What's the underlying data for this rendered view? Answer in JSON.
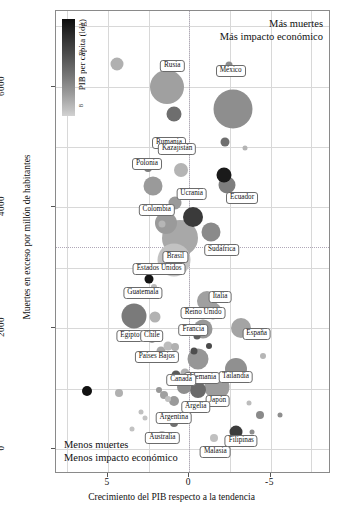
{
  "chart_data": {
    "type": "scatter",
    "title": "",
    "xlabel": "Crecimiento del PIB respecto a la tendencia",
    "ylabel": "Muertes en exceso por millón de habitantes",
    "xlim": [
      8.2,
      -8.6
    ],
    "ylim": [
      -380,
      7250
    ],
    "xticks": [
      5,
      0,
      -5
    ],
    "xtick_labels": [
      "5",
      "0",
      "-5"
    ],
    "yticks": [
      0,
      2000,
      4000,
      6000
    ],
    "ytick_labels": [
      "0",
      "2000",
      "4000",
      "6000"
    ],
    "grid": true,
    "zero_reference_lines": {
      "x": 0,
      "y": 3350
    },
    "legend_position": "top-left-inside",
    "colorbar": {
      "label": "PIB per cápita (log)",
      "ticks": [
        "8",
        "9",
        "10",
        "11"
      ],
      "low_color": "#d2d2d2",
      "high_color": "#0d0d0d"
    },
    "annotations": {
      "top_right_line1": "Más muertes",
      "top_right_line2": "Más impacto económico",
      "bottom_left_line1": "Menos muertes",
      "bottom_left_line2": "Menos impacto económico"
    },
    "points": [
      {
        "label": "Rusia",
        "x": 1.35,
        "y": 5990,
        "size": 34,
        "color": "#a0a0a0",
        "lx": 1.05,
        "ly": 6340
      },
      {
        "label": "Rumania",
        "x": 0.95,
        "y": 5540,
        "size": 15,
        "color": "#6e6e6e",
        "lx": 1.25,
        "ly": 5060
      },
      {
        "label": "México",
        "x": -2.7,
        "y": 5630,
        "size": 39,
        "color": "#8e8e8e",
        "lx": -2.55,
        "ly": 6260
      },
      {
        "label": "Kazajistán",
        "x": 0.5,
        "y": 4620,
        "size": 14,
        "color": "#b4b4b4",
        "lx": 0.75,
        "ly": 4960
      },
      {
        "label": "Polonia",
        "x": 2.25,
        "y": 4360,
        "size": 19,
        "color": "#9a9a9a",
        "lx": 2.6,
        "ly": 4720
      },
      {
        "label": "Ecuador",
        "x": -2.35,
        "y": 4370,
        "size": 17,
        "color": "#7e7e7e",
        "lx": -3.25,
        "ly": 4160
      },
      {
        "label": "Ucrania",
        "x": -0.25,
        "y": 3840,
        "size": 20,
        "color": "#3a3a3a",
        "lx": -0.15,
        "ly": 4220
      },
      {
        "label": "Colombia",
        "x": 1.45,
        "y": 3740,
        "size": 22,
        "color": "#9a9a9a",
        "lx": 2.0,
        "ly": 3960
      },
      {
        "label": "Sudáfrica",
        "x": -1.35,
        "y": 3600,
        "size": 19,
        "color": "#8a8a8a",
        "lx": -2.0,
        "ly": 3290
      },
      {
        "label": "Brasil",
        "x": 0.55,
        "y": 3500,
        "size": 36,
        "color": "#a8a8a8",
        "lx": 0.85,
        "ly": 3180
      },
      {
        "label": "Estados Unidos",
        "x": 0.95,
        "y": 3130,
        "size": 33,
        "color": "#c2c2c2",
        "lx": 1.85,
        "ly": 2980
      },
      {
        "label": "Guatemala",
        "x": 2.45,
        "y": 2820,
        "size": 9,
        "color": "#141414",
        "lx": 2.85,
        "ly": 2580
      },
      {
        "label": "Egipto",
        "x": 3.4,
        "y": 2200,
        "size": 25,
        "color": "#7a7a7a",
        "lx": 3.65,
        "ly": 1880
      },
      {
        "label": "Italia",
        "x": -1.1,
        "y": 2450,
        "size": 20,
        "color": "#a0a0a0",
        "lx": -1.9,
        "ly": 2520
      },
      {
        "label": "Reino Unido",
        "x": -1.45,
        "y": 2290,
        "size": 17,
        "color": "#a0a0a0",
        "lx": -0.85,
        "ly": 2260
      },
      {
        "label": "Francia",
        "x": -0.85,
        "y": 1980,
        "size": 19,
        "color": "#989898",
        "lx": -0.25,
        "ly": 1970
      },
      {
        "label": "España",
        "x": -3.2,
        "y": 2000,
        "size": 20,
        "color": "#a4a4a4",
        "lx": -4.15,
        "ly": 1900
      },
      {
        "label": "Chile",
        "x": 2.3,
        "y": 1840,
        "size": 10,
        "color": "#9e9e9e",
        "lx": 2.3,
        "ly": 1880
      },
      {
        "label": "Países Bajos",
        "x": 1.75,
        "y": 1620,
        "size": 9,
        "color": "#a8a8a8",
        "lx": 2.0,
        "ly": 1530
      },
      {
        "label": "Alemania",
        "x": -0.55,
        "y": 1490,
        "size": 21,
        "color": "#969696",
        "lx": -0.8,
        "ly": 1180
      },
      {
        "label": "Tailandia",
        "x": -2.9,
        "y": 1320,
        "size": 22,
        "color": "#909090",
        "lx": -2.85,
        "ly": 1200
      },
      {
        "label": "Canadá",
        "x": 0.25,
        "y": 1260,
        "size": 9,
        "color": "#b0b0b0",
        "lx": 0.5,
        "ly": 1140
      },
      {
        "label": "Japón",
        "x": -1.7,
        "y": 1020,
        "size": 25,
        "color": "#9c9c9c",
        "lx": -1.75,
        "ly": 800
      },
      {
        "label": "Argelia",
        "x": -0.55,
        "y": 980,
        "size": 16,
        "color": "#6a6a6a",
        "lx": -0.4,
        "ly": 700
      },
      {
        "label": "Argentina",
        "x": 0.95,
        "y": 790,
        "size": 10,
        "color": "#9a9a9a",
        "lx": 0.95,
        "ly": 520
      },
      {
        "label": "Australia",
        "x": 1.65,
        "y": 230,
        "size": 8,
        "color": "#b8b8b8",
        "lx": 1.65,
        "ly": 180
      },
      {
        "label": "Filipinas",
        "x": -2.85,
        "y": 290,
        "size": 13,
        "color": "#3c3c3c",
        "lx": -3.2,
        "ly": 130
      },
      {
        "label": "Malasia",
        "x": -1.5,
        "y": 190,
        "size": 8,
        "color": "#c0c0c0",
        "lx": -1.6,
        "ly": -40
      },
      {
        "label": "",
        "x": 4.45,
        "y": 6370,
        "size": 13,
        "color": "#b0b0b0",
        "lx": null,
        "ly": null
      },
      {
        "label": "",
        "x": -2.45,
        "y": 6360,
        "size": 7,
        "color": "#8c8c8c",
        "lx": null,
        "ly": null
      },
      {
        "label": "",
        "x": -2.2,
        "y": 5080,
        "size": 9,
        "color": "#6e6e6e",
        "lx": null,
        "ly": null
      },
      {
        "label": "",
        "x": -3.4,
        "y": 4980,
        "size": 5,
        "color": "#b4b4b4",
        "lx": null,
        "ly": null
      },
      {
        "label": "",
        "x": 2.55,
        "y": 4650,
        "size": 8,
        "color": "#7e7e7e",
        "lx": null,
        "ly": null
      },
      {
        "label": "",
        "x": -2.15,
        "y": 4530,
        "size": 15,
        "color": "#1a1a1a",
        "lx": null,
        "ly": null
      },
      {
        "label": "",
        "x": 1.7,
        "y": 3720,
        "size": 7,
        "color": "#b6b6b6",
        "lx": null,
        "ly": null
      },
      {
        "label": "",
        "x": 0.9,
        "y": 4080,
        "size": 13,
        "color": "#9a9a9a",
        "lx": null,
        "ly": null
      },
      {
        "label": "",
        "x": 2.15,
        "y": 2690,
        "size": 6,
        "color": "#bcbcbc",
        "lx": null,
        "ly": null
      },
      {
        "label": "",
        "x": 2.1,
        "y": 2190,
        "size": 11,
        "color": "#b2b2b2",
        "lx": null,
        "ly": null
      },
      {
        "label": "",
        "x": -1.8,
        "y": 2520,
        "size": 10,
        "color": "#a8a8a8",
        "lx": null,
        "ly": null
      },
      {
        "label": "",
        "x": -0.5,
        "y": 1870,
        "size": 7,
        "color": "#5e5e5e",
        "lx": null,
        "ly": null
      },
      {
        "label": "",
        "x": -0.3,
        "y": 1620,
        "size": 7,
        "color": "#4e4e4e",
        "lx": null,
        "ly": null
      },
      {
        "label": "",
        "x": 1.3,
        "y": 1700,
        "size": 9,
        "color": "#bcbcbc",
        "lx": null,
        "ly": null
      },
      {
        "label": "",
        "x": 0.85,
        "y": 1690,
        "size": 8,
        "color": "#b0b0b0",
        "lx": null,
        "ly": null
      },
      {
        "label": "",
        "x": -1.2,
        "y": 1700,
        "size": 6,
        "color": "#4a4a4a",
        "lx": null,
        "ly": null
      },
      {
        "label": "",
        "x": 0.35,
        "y": 1020,
        "size": 14,
        "color": "#8e8e8e",
        "lx": null,
        "ly": null
      },
      {
        "label": "",
        "x": 0.8,
        "y": 1230,
        "size": 9,
        "color": "#5a5a5a",
        "lx": null,
        "ly": null
      },
      {
        "label": "",
        "x": 1.55,
        "y": 900,
        "size": 8,
        "color": "#a0a0a0",
        "lx": null,
        "ly": null
      },
      {
        "label": "",
        "x": 1.85,
        "y": 980,
        "size": 6,
        "color": "#989898",
        "lx": null,
        "ly": null
      },
      {
        "label": "",
        "x": 4.3,
        "y": 930,
        "size": 8,
        "color": "#b0b0b0",
        "lx": null,
        "ly": null
      },
      {
        "label": "",
        "x": 6.3,
        "y": 960,
        "size": 10,
        "color": "#111111",
        "lx": null,
        "ly": null
      },
      {
        "label": "",
        "x": 1.3,
        "y": 830,
        "size": 6,
        "color": "#c0c0c0",
        "lx": null,
        "ly": null
      },
      {
        "label": "",
        "x": -1.25,
        "y": 850,
        "size": 5,
        "color": "#b8b8b8",
        "lx": null,
        "ly": null
      },
      {
        "label": "",
        "x": -3.65,
        "y": 760,
        "size": 5,
        "color": "#bcbcbc",
        "lx": null,
        "ly": null
      },
      {
        "label": "",
        "x": -4.35,
        "y": 560,
        "size": 8,
        "color": "#8a8a8a",
        "lx": null,
        "ly": null
      },
      {
        "label": "",
        "x": -5.6,
        "y": 560,
        "size": 5,
        "color": "#8e8e8e",
        "lx": null,
        "ly": null
      },
      {
        "label": "",
        "x": 3.0,
        "y": 620,
        "size": 5,
        "color": "#c0c0c0",
        "lx": null,
        "ly": null
      },
      {
        "label": "",
        "x": 2.7,
        "y": 520,
        "size": 5,
        "color": "#c4c4c4",
        "lx": null,
        "ly": null
      },
      {
        "label": "",
        "x": 3.5,
        "y": 330,
        "size": 5,
        "color": "#c2c2c2",
        "lx": null,
        "ly": null
      },
      {
        "label": "",
        "x": -3.85,
        "y": 290,
        "size": 5,
        "color": "#8e8e8e",
        "lx": null,
        "ly": null
      },
      {
        "label": "",
        "x": 0.95,
        "y": 430,
        "size": 8,
        "color": "#707070",
        "lx": null,
        "ly": null
      },
      {
        "label": "",
        "x": -4.55,
        "y": 1540,
        "size": 6,
        "color": "#b6b6b6",
        "lx": null,
        "ly": null
      }
    ]
  }
}
